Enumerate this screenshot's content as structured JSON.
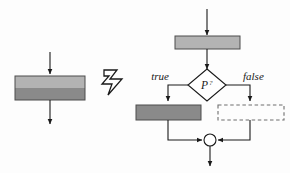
{
  "diagram": {
    "type": "flowchart-refinement",
    "background_color": "#fdfdfd",
    "stroke_color": "#1a1a1a",
    "colors": {
      "light_block": "#b3b3b3",
      "dark_block": "#8a8a8a",
      "outline": "#4d4d4d",
      "line": "#1a1a1a",
      "dashed": "#6e6e6e",
      "merge_fill": "#ffffff"
    },
    "left": {
      "name": "compound-activity",
      "block": {
        "name": "two-tone-block",
        "top_half_color": "#b3b3b3",
        "bottom_half_color": "#8a8a8a",
        "label": ""
      },
      "in_arrow": {
        "name": "incoming-arrow",
        "label": ""
      },
      "out_arrow": {
        "name": "outgoing-arrow",
        "label": ""
      }
    },
    "transform": {
      "name": "zigzag-transform-arrow",
      "glyph": "zigzag-arrow-right",
      "label": ""
    },
    "right": {
      "name": "refined-flowchart",
      "in_arrow": {
        "name": "incoming-arrow",
        "label": ""
      },
      "first_action": {
        "name": "light-action-block",
        "fill": "#b3b3b3",
        "label": ""
      },
      "decision": {
        "name": "decision-diamond",
        "label": "P",
        "label_suffix": "?",
        "full_label": "P?"
      },
      "branch_true": {
        "name": "true-branch-label",
        "label": "true"
      },
      "branch_false": {
        "name": "false-branch-label",
        "label": "false"
      },
      "true_action": {
        "name": "dark-action-block",
        "fill": "#8a8a8a",
        "label": ""
      },
      "false_action": {
        "name": "empty-dashed-block",
        "fill": "none",
        "style": "dashed",
        "label": ""
      },
      "merge": {
        "name": "merge-circle",
        "label": ""
      },
      "out_arrow": {
        "name": "outgoing-arrow",
        "label": ""
      }
    }
  }
}
